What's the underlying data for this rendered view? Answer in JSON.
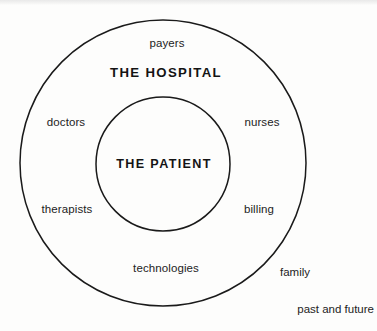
{
  "diagram": {
    "type": "concentric-circle-venn",
    "title_inner": "THE PATIENT",
    "title_outer": "THE HOSPITAL",
    "stroke_color": "#1a1a1a",
    "background_color": "#fdfdfc",
    "text_color": "#232323",
    "geometry": {
      "outer_circle": {
        "cx": 163,
        "cy": 163,
        "r": 143
      },
      "inner_circle": {
        "cx": 163,
        "cy": 164,
        "r": 67
      }
    },
    "inner_zone": {
      "label": "THE PATIENT"
    },
    "outer_zone": {
      "label": "THE HOSPITAL",
      "items": [
        {
          "label": "payers"
        },
        {
          "label": "doctors"
        },
        {
          "label": "nurses"
        },
        {
          "label": "therapists"
        },
        {
          "label": "billing"
        },
        {
          "label": "technologies"
        }
      ]
    },
    "outside_items": [
      {
        "label": "family"
      },
      {
        "label": "past and future"
      }
    ]
  }
}
